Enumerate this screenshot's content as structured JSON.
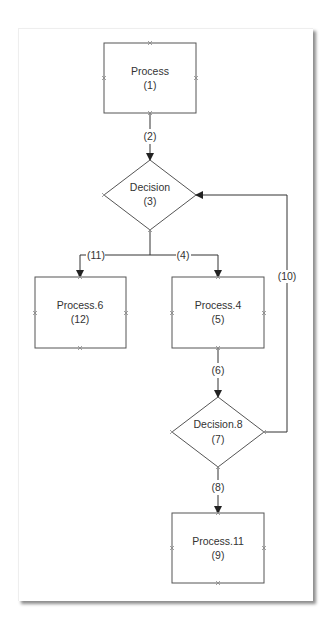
{
  "diagram": {
    "type": "flowchart",
    "nodes": [
      {
        "id": "1",
        "kind": "process",
        "title": "Process",
        "number": "(1)"
      },
      {
        "id": "3",
        "kind": "decision",
        "title": "Decision",
        "number": "(3)"
      },
      {
        "id": "12",
        "kind": "process",
        "title": "Process.6",
        "number": "(12)"
      },
      {
        "id": "5",
        "kind": "process",
        "title": "Process.4",
        "number": "(5)"
      },
      {
        "id": "7",
        "kind": "decision",
        "title": "Decision.8",
        "number": "(7)"
      },
      {
        "id": "9",
        "kind": "process",
        "title": "Process.11",
        "number": "(9)"
      }
    ],
    "edges": [
      {
        "label": "(2)",
        "from": "1",
        "to": "3"
      },
      {
        "label": "(11)",
        "from": "3",
        "to": "12"
      },
      {
        "label": "(4)",
        "from": "3",
        "to": "5"
      },
      {
        "label": "(6)",
        "from": "5",
        "to": "7"
      },
      {
        "label": "(10)",
        "from": "7",
        "to": "3"
      },
      {
        "label": "(8)",
        "from": "7",
        "to": "9"
      }
    ],
    "colors": {
      "shape_stroke": "#555555",
      "edge_stroke": "#333333",
      "text": "#333333",
      "background": "#ffffff"
    }
  }
}
